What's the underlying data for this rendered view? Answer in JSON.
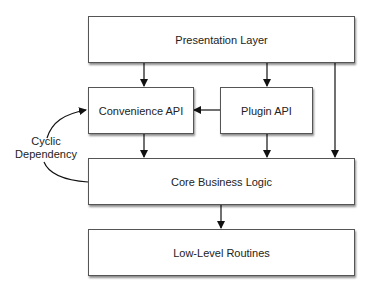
{
  "diagram": {
    "nodes": {
      "presentation": "Presentation Layer",
      "convenience": "Convenience API",
      "plugin": "Plugin API",
      "core": "Core Business Logic",
      "lowlevel": "Low-Level Routines"
    },
    "annotation": {
      "line1": "Cyclic",
      "line2": "Dependency"
    },
    "edges": [
      {
        "from": "Presentation Layer",
        "to": "Convenience API"
      },
      {
        "from": "Presentation Layer",
        "to": "Plugin API"
      },
      {
        "from": "Presentation Layer",
        "to": "Core Business Logic"
      },
      {
        "from": "Plugin API",
        "to": "Convenience API"
      },
      {
        "from": "Convenience API",
        "to": "Core Business Logic"
      },
      {
        "from": "Plugin API",
        "to": "Core Business Logic"
      },
      {
        "from": "Core Business Logic",
        "to": "Low-Level Routines"
      },
      {
        "from": "Core Business Logic",
        "to": "Convenience API",
        "label": "Cyclic Dependency"
      }
    ]
  }
}
